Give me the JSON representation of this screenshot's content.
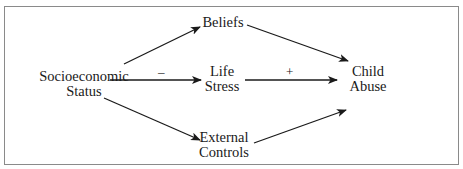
{
  "diagram": {
    "nodes": {
      "ses": {
        "line1": "Socioeconomic",
        "line2": "Status"
      },
      "beliefs": {
        "line1": "Beliefs"
      },
      "life_stress": {
        "line1": "Life",
        "line2": "Stress"
      },
      "external_controls": {
        "line1": "External",
        "line2": "Controls"
      },
      "child_abuse": {
        "line1": "Child",
        "line2": "Abuse"
      }
    },
    "edges": [
      {
        "from": "ses",
        "to": "beliefs",
        "sign": ""
      },
      {
        "from": "beliefs",
        "to": "child_abuse",
        "sign": ""
      },
      {
        "from": "ses",
        "to": "life_stress",
        "sign": "–"
      },
      {
        "from": "life_stress",
        "to": "child_abuse",
        "sign": "+"
      },
      {
        "from": "ses",
        "to": "external_controls",
        "sign": ""
      },
      {
        "from": "external_controls",
        "to": "child_abuse",
        "sign": ""
      }
    ],
    "signs": {
      "ses_life": "–",
      "life_child": "+"
    },
    "colors": {
      "line": "#1a1a1a",
      "frame": "#8a8a8a"
    }
  }
}
